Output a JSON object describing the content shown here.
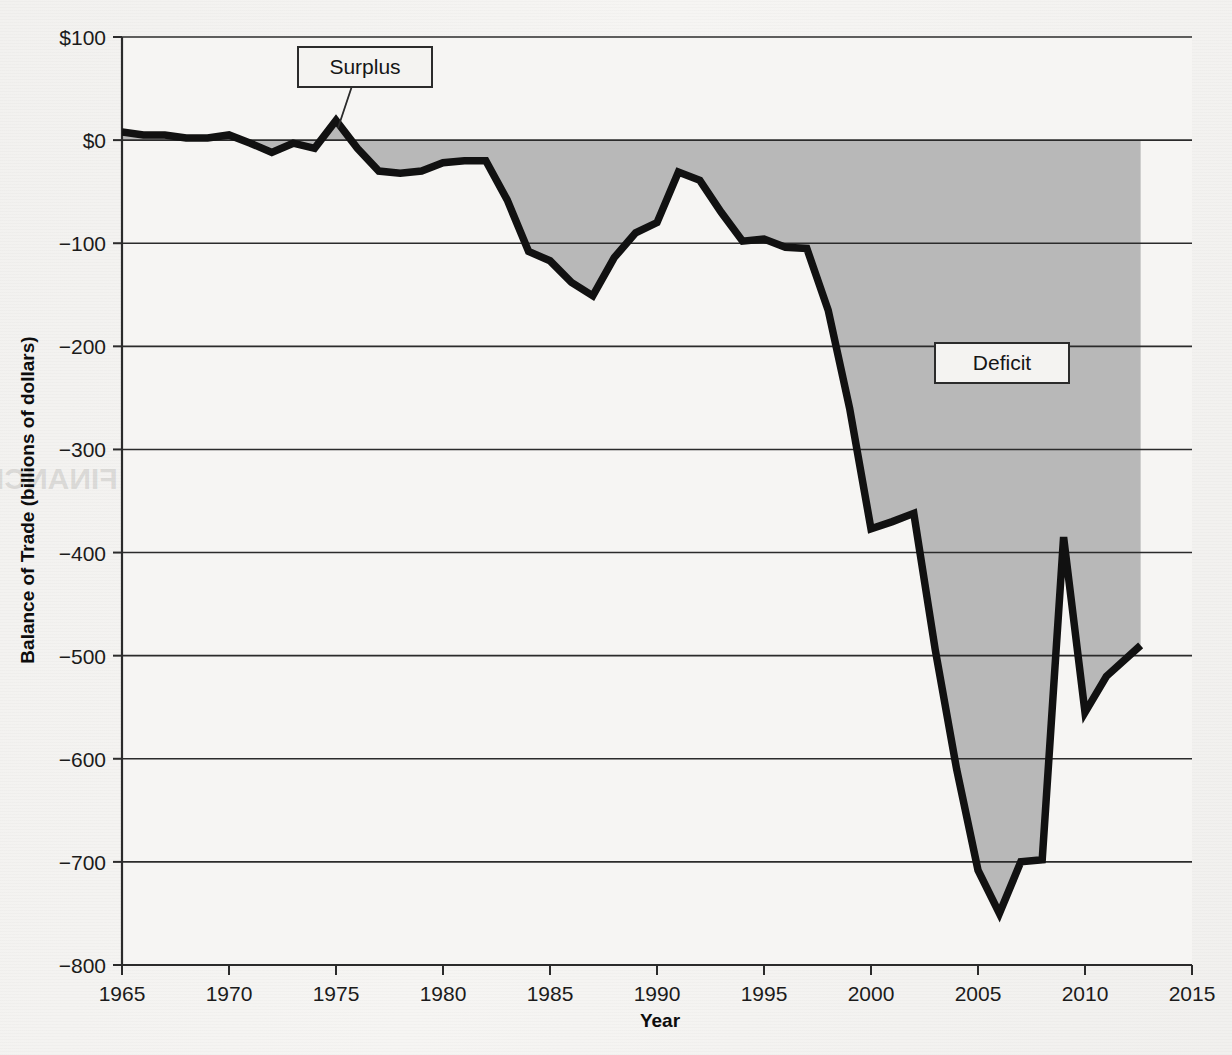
{
  "figure": {
    "background_color": "#f4f3f1",
    "plot_background_color": "#f6f5f3",
    "fill_color": "#b8b8b8",
    "line_color": "#111111",
    "axis_color": "#2b2b2b"
  },
  "annotations": {
    "surplus": {
      "label": "Surplus",
      "x_value": 1975,
      "y_value": 12
    },
    "deficit": {
      "label": "Deficit",
      "x_value": 2005,
      "y_value": -205
    }
  },
  "ghost_page_text": [
    "the trade balance. The",
    "In this case, the trade defic",
    "it. Between 1975 and 19",
    "merchandise trade deficit ro",
    "U.S. foreign indebtedness. Valu",
    "imports exceeded exports, th",
    "in the trade balance."
  ],
  "ghost_heading": "THE FINANCIAL ACCOUNT",
  "chart_data": {
    "type": "area",
    "title": "",
    "subtitle": "",
    "xlabel": "Year",
    "ylabel": "Balance of Trade (billions of dollars)",
    "xlim": [
      1965,
      2015
    ],
    "ylim": [
      -800,
      100
    ],
    "xticks": [
      1965,
      1970,
      1975,
      1980,
      1985,
      1990,
      1995,
      2000,
      2005,
      2010,
      2015
    ],
    "xtick_labels": [
      "1965",
      "1970",
      "1975",
      "1980",
      "1985",
      "1990",
      "1995",
      "2000",
      "2005",
      "2010",
      "2015"
    ],
    "yticks": [
      100,
      0,
      -100,
      -200,
      -300,
      -400,
      -500,
      -600,
      -700,
      -800
    ],
    "ytick_labels": [
      "$100",
      "$0",
      "−100",
      "−200",
      "−300",
      "−400",
      "−500",
      "−600",
      "−700",
      "−800"
    ],
    "grid": true,
    "legend": "none",
    "baseline": 0,
    "series": [
      {
        "name": "U.S. Balance of Trade",
        "x": [
          1965,
          1966,
          1967,
          1968,
          1969,
          1970,
          1971,
          1972,
          1973,
          1974,
          1975,
          1976,
          1977,
          1978,
          1979,
          1980,
          1981,
          1982,
          1983,
          1984,
          1985,
          1986,
          1987,
          1988,
          1989,
          1990,
          1991,
          1992,
          1993,
          1994,
          1995,
          1996,
          1997,
          1998,
          1999,
          2000,
          2001,
          2002,
          2003,
          2004,
          2005,
          2006,
          2007,
          2008,
          2009,
          2010,
          2011,
          2012.6
        ],
        "values": [
          8,
          5,
          5,
          2,
          2,
          5,
          -3,
          -12,
          -3,
          -8,
          19,
          -8,
          -30,
          -32,
          -30,
          -22,
          -20,
          -20,
          -58,
          -108,
          -117,
          -138,
          -151,
          -114,
          -90,
          -80,
          -31,
          -39,
          -70,
          -98,
          -96,
          -104,
          -105,
          -165,
          -260,
          -377,
          -370,
          -362,
          -494,
          -610,
          -708,
          -750,
          -700,
          -698,
          -385,
          -555,
          -520,
          -490
        ],
        "units": "billions of dollars"
      }
    ],
    "notes": [
      "Shaded region between the trade-balance line and the $0 baseline.",
      "Values above $0 are a trade surplus; values below are a trade deficit."
    ]
  }
}
